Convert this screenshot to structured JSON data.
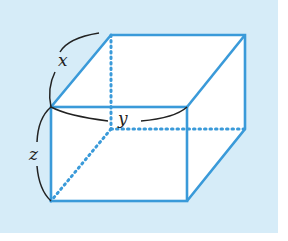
{
  "diagram": {
    "type": "cuboid",
    "labels": {
      "x": "x",
      "y": "y",
      "z": "z"
    },
    "colors": {
      "background": "#d6ecf8",
      "edge": "#3a9ad9",
      "face": "#ffffff",
      "arc": "#222222"
    }
  }
}
